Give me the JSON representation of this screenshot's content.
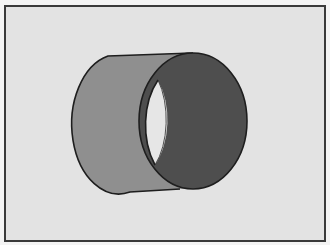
{
  "figure": {
    "colors": {
      "page": "#f4f4f4",
      "background": "#e3e3e3",
      "frame": "#3a3a3a",
      "side": "#8f8f8f",
      "end_face": "#4e4e4e",
      "hole": "#e6e6e6",
      "outline": "#1e1e1e"
    }
  }
}
